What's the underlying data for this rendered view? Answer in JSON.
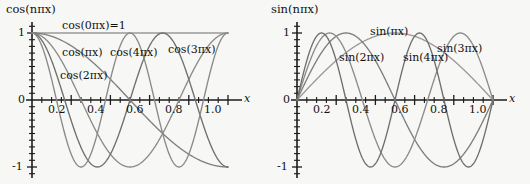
{
  "figure": {
    "background": "#f7f7f5",
    "curve_color": "#8a8a8a",
    "axis_color": "#1b1b1b"
  },
  "chart_data": [
    {
      "type": "line",
      "title": "cos(nπx)",
      "xlabel": "x",
      "ylabel": "",
      "xlim": [
        0,
        1.08
      ],
      "ylim": [
        -1.12,
        1.12
      ],
      "grid": false,
      "legend_position": "inline-annotations",
      "xticks": [
        0.2,
        0.4,
        0.6,
        0.8,
        1.0
      ],
      "xtick_labels": [
        "0.2",
        "0.4",
        "0.6",
        "0.8",
        "1.0"
      ],
      "yticks": [
        -1,
        0,
        1
      ],
      "ytick_labels": [
        "-1",
        "0",
        "1"
      ],
      "x_minor_tick_step": 0.05,
      "y_minor_tick_step": 0.1,
      "series": [
        {
          "name": "cos(0πx)=1",
          "n": 0,
          "formula": "cos(0*pi*x)",
          "annotation": "cos(0πx)=1"
        },
        {
          "name": "cos(πx)",
          "n": 1,
          "formula": "cos(1*pi*x)",
          "annotation": "cos(πx)"
        },
        {
          "name": "cos(2πx)",
          "n": 2,
          "formula": "cos(2*pi*x)",
          "annotation": "cos(2πx)"
        },
        {
          "name": "cos(3πx)",
          "n": 3,
          "formula": "cos(3*pi*x)",
          "annotation": "cos(3πx)"
        },
        {
          "name": "cos(4πx)",
          "n": 4,
          "formula": "cos(4*pi*x)",
          "annotation": "cos(4πx)"
        }
      ]
    },
    {
      "type": "line",
      "title": "sin(nπx)",
      "xlabel": "x",
      "ylabel": "",
      "xlim": [
        0,
        1.08
      ],
      "ylim": [
        -1.12,
        1.12
      ],
      "grid": false,
      "legend_position": "inline-annotations",
      "xticks": [
        0.2,
        0.4,
        0.6,
        0.8,
        1.0
      ],
      "xtick_labels": [
        "0.2",
        "0.4",
        "0.6",
        "0.8",
        "1.0"
      ],
      "yticks": [
        -1,
        0,
        1
      ],
      "ytick_labels": [
        "-1",
        "0",
        "1"
      ],
      "x_minor_tick_step": 0.05,
      "y_minor_tick_step": 0.1,
      "series": [
        {
          "name": "sin(πx)",
          "n": 1,
          "formula": "sin(1*pi*x)",
          "annotation": "sin(πx)"
        },
        {
          "name": "sin(2πx)",
          "n": 2,
          "formula": "sin(2*pi*x)",
          "annotation": "sin(2πx)"
        },
        {
          "name": "sin(3πx)",
          "n": 3,
          "formula": "sin(3*pi*x)",
          "annotation": "sin(3πx)"
        },
        {
          "name": "sin(4πx)",
          "n": 4,
          "formula": "sin(4*pi*x)",
          "annotation": "sin(4πx)"
        }
      ]
    }
  ],
  "left_panel": {
    "title": "cos(nπx)",
    "axis_name_x": "x",
    "ytick_1": "1",
    "ytick_0": "0",
    "ytick_m1": "-1",
    "xtick_02": "0.2",
    "xtick_04": "0.4",
    "xtick_06": "0.6",
    "xtick_08": "0.8",
    "xtick_10": "1.0",
    "ann_cos0": "cos(0πx)=1",
    "ann_cos1": "cos(πx)",
    "ann_cos2": "cos(2πx)",
    "ann_cos3": "cos(3πx)",
    "ann_cos4": "cos(4πx)"
  },
  "right_panel": {
    "title": "sin(nπx)",
    "axis_name_x": "x",
    "ytick_1": "1",
    "ytick_0": "0",
    "ytick_m1": "-1",
    "xtick_02": "0.2",
    "xtick_04": "0.4",
    "xtick_06": "0.6",
    "xtick_08": "0.8",
    "xtick_10": "1.0",
    "ann_sin1": "sin(πx)",
    "ann_sin2": "sin(2πx)",
    "ann_sin3": "sin(3πx)",
    "ann_sin4": "sin(4πx)"
  }
}
